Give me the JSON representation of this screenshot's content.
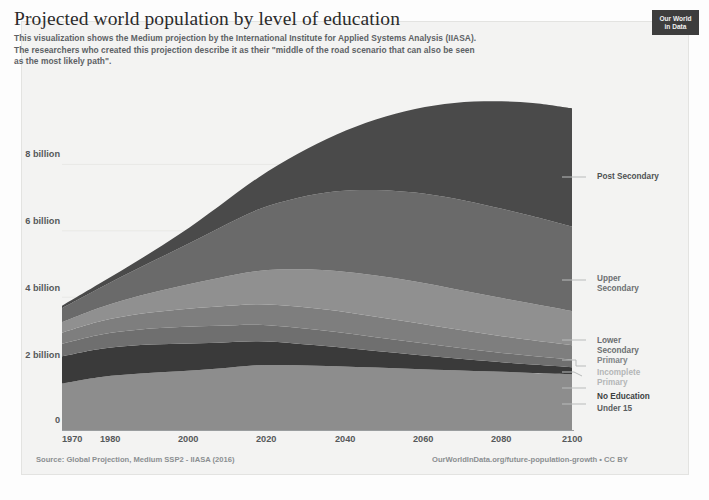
{
  "header": {
    "title": "Projected world population by level of education",
    "subtitle_lines": [
      "This visualization shows the Medium projection by the International Institute for Applied Systems Analysis (IIASA).",
      " The researchers who created this projection describe it as their \"middle of the road scenario that can also be seen",
      "as the most likely path\"."
    ],
    "logo_line1": "Our World",
    "logo_line2": "in Data"
  },
  "footer": {
    "source": "Source: Global Projection, Medium SSP2 - IIASA (2016)",
    "attribution": "OurWorldInData.org/future-population-growth • CC BY"
  },
  "axes": {
    "y_ticks": [
      "0",
      "2 billion",
      "4 billion",
      "6 billion",
      "8 billion"
    ],
    "x_ticks": [
      "1970",
      "1980",
      "2000",
      "2020",
      "2040",
      "2060",
      "2080",
      "2100"
    ]
  },
  "legend": {
    "post_secondary": "Post Secondary",
    "upper_secondary_l1": "Upper",
    "upper_secondary_l2": "Secondary",
    "lower_secondary_l1": "Lower",
    "lower_secondary_l2": "Secondary",
    "primary": "Primary",
    "incomplete_primary_l1": "Incomplete",
    "incomplete_primary_l2": "Primary",
    "no_education": "No Education",
    "under_15": "Under 15"
  },
  "colors": {
    "under_15": "#8d8d8d",
    "no_education": "#3a3a3a",
    "incomplete_primary": "#6f6f6f",
    "primary": "#7e7e7e",
    "lower_secondary": "#909090",
    "upper_secondary": "#6a6a6a",
    "post_secondary": "#4a4a4a",
    "background": "#f3f3f2",
    "axis_text": "#56595b",
    "logo_bg": "#3d3d3d"
  },
  "chart_data": {
    "type": "area",
    "title": "Projected world population by level of education",
    "xlabel": "",
    "ylabel": "",
    "ylim": [
      0,
      10
    ],
    "xlim": [
      1970,
      2100
    ],
    "grid": true,
    "legend_position": "right",
    "stacked": true,
    "unit": "billion people",
    "x": [
      1970,
      1980,
      1990,
      2000,
      2010,
      2020,
      2030,
      2040,
      2050,
      2060,
      2070,
      2080,
      2090,
      2100
    ],
    "series": [
      {
        "name": "Under 15",
        "values": [
          1.4,
          1.6,
          1.7,
          1.77,
          1.85,
          1.95,
          1.95,
          1.92,
          1.88,
          1.84,
          1.8,
          1.76,
          1.72,
          1.68
        ]
      },
      {
        "name": "No Education",
        "values": [
          0.82,
          0.85,
          0.86,
          0.83,
          0.78,
          0.72,
          0.65,
          0.58,
          0.5,
          0.43,
          0.36,
          0.3,
          0.25,
          0.21
        ]
      },
      {
        "name": "Incomplete Primary",
        "values": [
          0.38,
          0.43,
          0.47,
          0.5,
          0.51,
          0.5,
          0.48,
          0.45,
          0.41,
          0.37,
          0.33,
          0.29,
          0.26,
          0.23
        ]
      },
      {
        "name": "Primary",
        "values": [
          0.33,
          0.4,
          0.47,
          0.53,
          0.58,
          0.62,
          0.64,
          0.64,
          0.62,
          0.59,
          0.55,
          0.51,
          0.47,
          0.43
        ]
      },
      {
        "name": "Lower Secondary",
        "values": [
          0.32,
          0.42,
          0.55,
          0.7,
          0.86,
          1.0,
          1.12,
          1.2,
          1.24,
          1.24,
          1.21,
          1.16,
          1.1,
          1.03
        ]
      },
      {
        "name": "Upper Secondary",
        "values": [
          0.42,
          0.6,
          0.85,
          1.15,
          1.5,
          1.85,
          2.15,
          2.4,
          2.58,
          2.68,
          2.72,
          2.7,
          2.64,
          2.55
        ]
      },
      {
        "name": "Post Secondary",
        "values": [
          0.07,
          0.14,
          0.25,
          0.42,
          0.66,
          0.96,
          1.32,
          1.71,
          2.12,
          2.52,
          2.88,
          3.18,
          3.41,
          3.56
        ]
      }
    ],
    "totals": [
      3.74,
      4.44,
      5.15,
      5.9,
      6.74,
      7.6,
      8.31,
      8.9,
      9.35,
      9.67,
      9.85,
      9.9,
      9.85,
      9.69
    ]
  }
}
